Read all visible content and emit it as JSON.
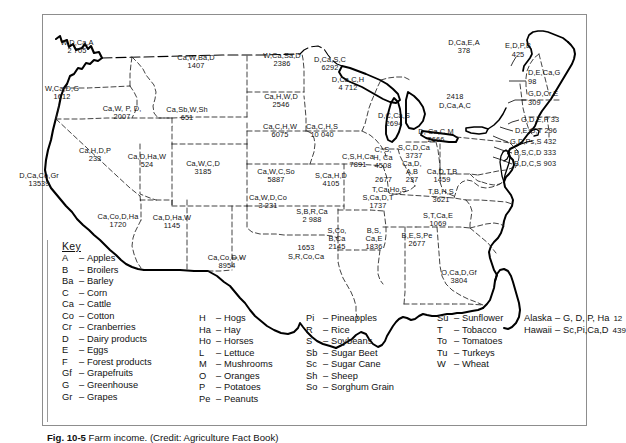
{
  "figure": {
    "caption_bold": "Fig. 10-5",
    "caption_text": "Farm income. (Credit: Agriculture Fact Book)"
  },
  "map": {
    "title": "United States agricultural products and farm income by state",
    "states": [
      {
        "id": "WA",
        "codes": "W,D,Ca,A",
        "value": "2 705",
        "x": 77,
        "y": 47
      },
      {
        "id": "OR",
        "codes": "W,Ca,D,G",
        "value": "1612",
        "x": 62,
        "y": 93
      },
      {
        "id": "ID",
        "codes": "Ca,W, P, D,",
        "value": "2007",
        "x": 122,
        "y": 113
      },
      {
        "id": "MT",
        "codes": "Ca,W,Ba,D",
        "value": "1407",
        "x": 196,
        "y": 62
      },
      {
        "id": "ND",
        "codes": "W,Ca,Sa,D",
        "value": "2386",
        "x": 282,
        "y": 60
      },
      {
        "id": "MN",
        "codes": "D,Ca,S,C",
        "value": "6292",
        "x": 330,
        "y": 64
      },
      {
        "id": "SD",
        "codes": "Ca,H,W,D",
        "value": "2546",
        "x": 281,
        "y": 101
      },
      {
        "id": "WY",
        "codes": "Ca,Sb,W,Sh",
        "value": "651",
        "x": 187,
        "y": 114
      },
      {
        "id": "NE",
        "codes": "Ca,C,H,W",
        "value": "6075",
        "x": 280,
        "y": 131
      },
      {
        "id": "WI",
        "codes": "D,Ca,C,H",
        "value": "4 712",
        "x": 348,
        "y": 84
      },
      {
        "id": "IA",
        "codes": "Ca,C,H,S",
        "value": "10 040",
        "x": 322,
        "y": 131
      },
      {
        "id": "NV",
        "codes": "Ca,H,D,P",
        "value": "233",
        "x": 95,
        "y": 155
      },
      {
        "id": "UT",
        "codes": "Ca,D,Ha,W",
        "value": "524",
        "x": 147,
        "y": 161
      },
      {
        "id": "CO",
        "codes": "Ca,W,C,D",
        "value": "3185",
        "x": 203,
        "y": 168
      },
      {
        "id": "CA",
        "codes": "D,Ca,Co,Gr",
        "value": "13539",
        "x": 39,
        "y": 180
      },
      {
        "id": "KS",
        "codes": "Ca,W,C,So",
        "value": "5887",
        "x": 276,
        "y": 176
      },
      {
        "id": "MO",
        "codes": "S,Ca,H,D",
        "value": "4105",
        "x": 331,
        "y": 180
      },
      {
        "id": "IL",
        "codes": "C,S,H,Ca",
        "value": "7891",
        "x": 358,
        "y": 161
      },
      {
        "id": "MI",
        "codes": "D,C,Ca,S",
        "value": "2694",
        "x": 394,
        "y": 120
      },
      {
        "id": "IN",
        "codes": "C, S,\nH, Ca",
        "value": "4508",
        "x": 383,
        "y": 158
      },
      {
        "id": "OH",
        "codes": "S,C,D,Ca",
        "value": "3737",
        "x": 414,
        "y": 152
      },
      {
        "id": "AZ",
        "codes": "Ca,Co,D,Ha",
        "value": "1720",
        "x": 118,
        "y": 221
      },
      {
        "id": "NM",
        "codes": "Ca,D,Ha,W",
        "value": "1145",
        "x": 172,
        "y": 222
      },
      {
        "id": "OK",
        "codes": "Ca,W,D,Co",
        "value": "3 231",
        "x": 268,
        "y": 202
      },
      {
        "id": "TX",
        "codes": "Ca,Co,D,W",
        "value": "8954",
        "x": 227,
        "y": 262
      },
      {
        "id": "AR",
        "codes": "S,B,R,Ca",
        "value": "2 988",
        "x": 312,
        "y": 216
      },
      {
        "id": "KY",
        "codes": "T,Ca,Ho,S",
        "value": "2677",
        "x": 398,
        "y": 183
      },
      {
        "id": "TN",
        "codes": "S,Ca,D,T",
        "value": "1737",
        "x": 375,
        "y": 202
      },
      {
        "id": "MS",
        "codes": "S,Co,\nB,Ca",
        "value": "2145",
        "x": 337,
        "y": 239
      },
      {
        "id": "LA",
        "codes": "S,R,Co,Ca",
        "value": "1653",
        "x": 308,
        "y": 254
      },
      {
        "id": "AL",
        "codes": "B,S,\nCa,E",
        "value": "1836",
        "x": 374,
        "y": 239
      },
      {
        "id": "GA",
        "codes": "B,E,S,Pe",
        "value": "2677",
        "x": 417,
        "y": 240
      },
      {
        "id": "FL",
        "codes": "O,Ca,D,Gf",
        "value": "3804",
        "x": 459,
        "y": 277
      },
      {
        "id": "SC",
        "codes": "S,T,Ca,E",
        "value": "1069",
        "x": 438,
        "y": 220
      },
      {
        "id": "NC",
        "codes": "T,B,H,S",
        "value": "3621",
        "x": 441,
        "y": 196
      },
      {
        "id": "VA",
        "codes": "Ca,D,T,B",
        "value": "1459",
        "x": 442,
        "y": 176
      },
      {
        "id": "WV",
        "codes": "Ca,D,\nA,B",
        "value": "237",
        "x": 412,
        "y": 172
      },
      {
        "id": "PA",
        "codes": "D, Ca,C,M",
        "value": "2666",
        "x": 436,
        "y": 136
      },
      {
        "id": "NY",
        "codes": "D,Ca,A,C",
        "value": "2418",
        "x": 455,
        "y": 103
      },
      {
        "id": "ME",
        "codes": "D,Ca,E,A",
        "value": "378",
        "x": 464,
        "y": 47
      },
      {
        "id": "VT",
        "codes": "E,D,P,B",
        "value": "425",
        "x": 516,
        "y": 51
      }
    ],
    "callouts": [
      {
        "id": "NH",
        "text": "D,E,Ca,G",
        "value": "98",
        "x": 538,
        "y": 82
      },
      {
        "id": "MA",
        "text": "G,D,Cr,E",
        "value": "309",
        "x": 538,
        "y": 100
      },
      {
        "id": "RI",
        "text": "G,D,E,P 33",
        "x": 531,
        "y": 119
      },
      {
        "id": "CT",
        "text": "D,E,G,T 296",
        "x": 525,
        "y": 130
      },
      {
        "id": "NJ",
        "text": "G,D,Ps,S 432",
        "x": 519,
        "y": 142
      },
      {
        "id": "DE",
        "text": "B,S,C,D 333",
        "x": 523,
        "y": 153
      },
      {
        "id": "MD",
        "text": "B,D,C,S 903",
        "x": 523,
        "y": 164
      }
    ]
  },
  "key": {
    "title": "Key",
    "column1": [
      {
        "abbr": "A",
        "name": "Apples"
      },
      {
        "abbr": "B",
        "name": "Broilers"
      },
      {
        "abbr": "Ba",
        "name": "Barley"
      },
      {
        "abbr": "C",
        "name": "Corn"
      },
      {
        "abbr": "Ca",
        "name": "Cattle"
      },
      {
        "abbr": "Co",
        "name": "Cotton"
      },
      {
        "abbr": "Cr",
        "name": "Cranberries"
      },
      {
        "abbr": "D",
        "name": "Dairy products"
      },
      {
        "abbr": "E",
        "name": "Eggs"
      },
      {
        "abbr": "F",
        "name": "Forest products"
      },
      {
        "abbr": "Gf",
        "name": "Grapefruits"
      },
      {
        "abbr": "G",
        "name": "Greenhouse"
      },
      {
        "abbr": "Gr",
        "name": "Grapes"
      }
    ],
    "column2": [
      {
        "abbr": "H",
        "name": "Hogs"
      },
      {
        "abbr": "Ha",
        "name": "Hay"
      },
      {
        "abbr": "Ho",
        "name": "Horses"
      },
      {
        "abbr": "L",
        "name": "Lettuce"
      },
      {
        "abbr": "M",
        "name": "Mushrooms"
      },
      {
        "abbr": "O",
        "name": "Oranges"
      },
      {
        "abbr": "P",
        "name": "Potatoes"
      },
      {
        "abbr": "Pe",
        "name": "Peanuts"
      }
    ],
    "column3": [
      {
        "abbr": "Pi",
        "name": "Pineapples"
      },
      {
        "abbr": "R",
        "name": "Rice"
      },
      {
        "abbr": "S",
        "name": "Soybeans"
      },
      {
        "abbr": "Sb",
        "name": "Sugar Beet"
      },
      {
        "abbr": "Sc",
        "name": "Sugar Cane"
      },
      {
        "abbr": "Sh",
        "name": "Sheep"
      },
      {
        "abbr": "So",
        "name": "Sorghum Grain"
      }
    ],
    "column4": [
      {
        "abbr": "Su",
        "name": "Sunflower"
      },
      {
        "abbr": "T",
        "name": "Tobacco"
      },
      {
        "abbr": "To",
        "name": "Tomatoes"
      },
      {
        "abbr": "Tu",
        "name": "Turkeys"
      },
      {
        "abbr": "W",
        "name": "Wheat"
      }
    ],
    "column5": [
      {
        "label": "Alaska",
        "dash": "–",
        "codes": "G, D, P, Ha",
        "value": "12"
      },
      {
        "label": "Hawaii",
        "dash": "–",
        "codes": "Sc,Pi,Ca,D",
        "value": "439"
      }
    ]
  }
}
